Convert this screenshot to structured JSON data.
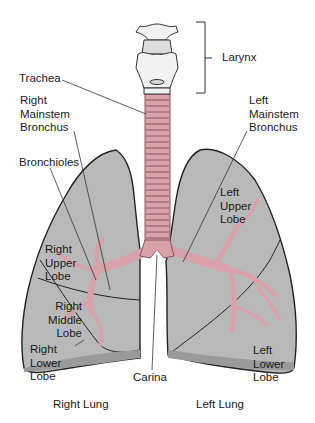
{
  "diagram": {
    "colors": {
      "lung_fill": "#b9b9b9",
      "lung_outline": "#222222",
      "airway_pink": "#d9a2aa",
      "airway_dark": "#8a5560",
      "larynx_fill": "#f2f2f2",
      "leader_line": "#333333",
      "background": "#ffffff"
    },
    "labels": {
      "larynx": "Larynx",
      "trachea": "Trachea",
      "right_mainstem_bronchus": "Right\nMainstem\nBronchus",
      "left_mainstem_bronchus": "Left\nMainstem\nBronchus",
      "bronchioles": "Bronchioles",
      "right_upper_lobe": "Right\nUpper\nLobe",
      "right_middle_lobe": "Right\nMiddle\nLobe",
      "right_lower_lobe": "Right\nLower\nLobe",
      "left_upper_lobe": "Left\nUpper\nLobe",
      "left_lower_lobe": "Left\nLower\nLobe",
      "carina": "Carina",
      "right_lung": "Right Lung",
      "left_lung": "Left Lung"
    }
  }
}
